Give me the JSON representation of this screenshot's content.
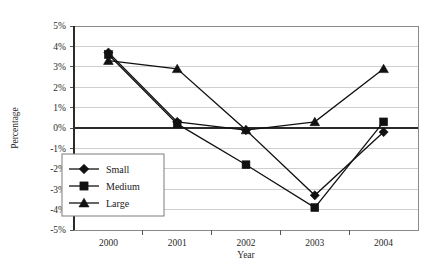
{
  "chart_data": {
    "type": "line",
    "title": "",
    "xlabel": "Year",
    "ylabel": "Percentage",
    "categories": [
      "2000",
      "2001",
      "2002",
      "2003",
      "2004"
    ],
    "ylim": [
      -5,
      5
    ],
    "ytick_labels": [
      "5%",
      "4%",
      "3%",
      "2%",
      "1%",
      "0%",
      "-1%",
      "-2%",
      "-3%",
      "-4%",
      "-5%"
    ],
    "ytick_values": [
      5,
      4,
      3,
      2,
      1,
      0,
      -1,
      -2,
      -3,
      -4,
      -5
    ],
    "grid": "horizontal",
    "legend_position": "inside-lower-left",
    "series": [
      {
        "name": "Small",
        "marker": "diamond",
        "values": [
          3.7,
          0.3,
          -0.1,
          -3.3,
          -0.2
        ]
      },
      {
        "name": "Medium",
        "marker": "square",
        "values": [
          3.6,
          0.2,
          -1.8,
          -3.9,
          0.3
        ]
      },
      {
        "name": "Large",
        "marker": "triangle",
        "values": [
          3.3,
          2.9,
          -0.1,
          0.3,
          2.9
        ]
      }
    ]
  },
  "figure": {
    "caption": ""
  }
}
